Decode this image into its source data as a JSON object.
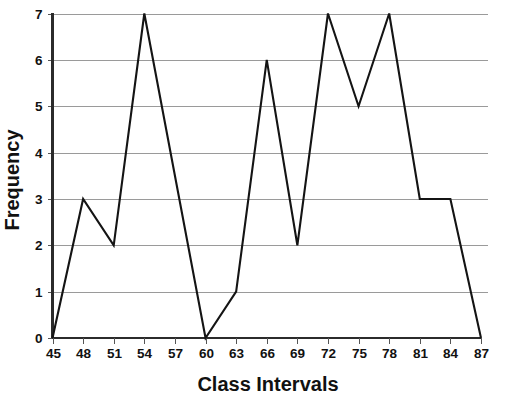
{
  "chart_data": {
    "type": "line",
    "title": "",
    "xlabel": "Class Intervals",
    "ylabel": "Frequency",
    "x": [
      45,
      48,
      51,
      54,
      57,
      60,
      63,
      66,
      69,
      72,
      75,
      78,
      81,
      84,
      87
    ],
    "values": [
      0,
      3,
      2,
      7,
      3.5,
      0,
      1,
      6,
      2,
      7,
      5,
      7,
      3,
      3,
      0
    ],
    "vertices": [
      {
        "x": 45,
        "y": 0
      },
      {
        "x": 48,
        "y": 3
      },
      {
        "x": 51,
        "y": 2
      },
      {
        "x": 54,
        "y": 7
      },
      {
        "x": 60,
        "y": 0
      },
      {
        "x": 63,
        "y": 1
      },
      {
        "x": 66,
        "y": 6
      },
      {
        "x": 69,
        "y": 2
      },
      {
        "x": 72,
        "y": 7
      },
      {
        "x": 75,
        "y": 5
      },
      {
        "x": 78,
        "y": 7
      },
      {
        "x": 81,
        "y": 3
      },
      {
        "x": 84,
        "y": 3
      },
      {
        "x": 87,
        "y": 0
      }
    ],
    "xticks": [
      "45",
      "48",
      "51",
      "54",
      "57",
      "60",
      "63",
      "66",
      "69",
      "72",
      "75",
      "78",
      "81",
      "84",
      "87"
    ],
    "xtick_values": [
      45,
      48,
      51,
      54,
      57,
      60,
      63,
      66,
      69,
      72,
      75,
      78,
      81,
      84,
      87
    ],
    "yticks": [
      "0",
      "1",
      "2",
      "3",
      "4",
      "5",
      "6",
      "7"
    ],
    "ytick_values": [
      0,
      1,
      2,
      3,
      4,
      5,
      6,
      7
    ],
    "xlim": [
      45,
      87
    ],
    "ylim": [
      0,
      7
    ],
    "grid": true,
    "grid_axis": "y",
    "legend": null,
    "series_color": "#141414",
    "grid_color": "#9a9a9a",
    "axis_color": "#2b2b2b",
    "background_color": "#ffffff"
  }
}
